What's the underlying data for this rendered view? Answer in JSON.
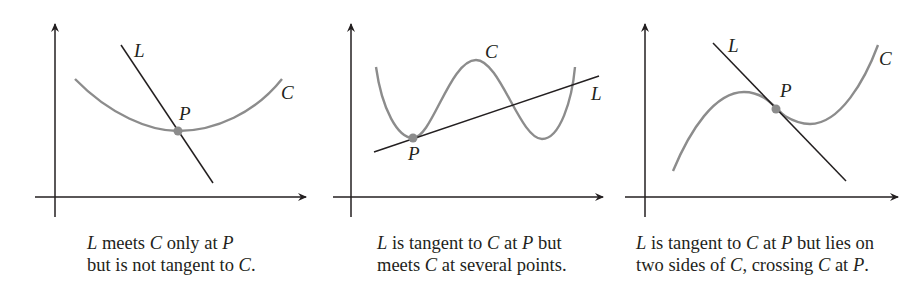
{
  "figure": {
    "colors": {
      "axis": "#231f20",
      "line": "#231f20",
      "curve": "#8c8c8c",
      "point": "#8c8c8c",
      "text": "#231f20"
    },
    "panels": [
      {
        "id": "panel-1",
        "labels": {
          "line": "L",
          "curve": "C",
          "point": "P"
        },
        "caption": {
          "line1": {
            "a": "L",
            "b": " meets ",
            "c": "C",
            "d": " only at ",
            "e": "P"
          },
          "line2": {
            "a": "but is not tangent to ",
            "b": "C",
            "c": "."
          }
        }
      },
      {
        "id": "panel-2",
        "labels": {
          "line": "L",
          "curve": "C",
          "point": "P"
        },
        "caption": {
          "line1": {
            "a": "L",
            "b": " is tangent to ",
            "c": "C",
            "d": " at ",
            "e": "P",
            "f": " but"
          },
          "line2": {
            "a": "meets ",
            "b": "C",
            "c": " at several points."
          }
        }
      },
      {
        "id": "panel-3",
        "labels": {
          "line": "L",
          "curve": "C",
          "point": "P"
        },
        "caption": {
          "line1": {
            "a": "L",
            "b": " is tangent to ",
            "c": "C",
            "d": " at ",
            "e": "P",
            "f": " but lies on"
          },
          "line2": {
            "a": "two sides of ",
            "b": "C",
            "c": ", crossing ",
            "d": "C",
            "e": " at ",
            "f": "P",
            "g": "."
          }
        }
      }
    ]
  }
}
